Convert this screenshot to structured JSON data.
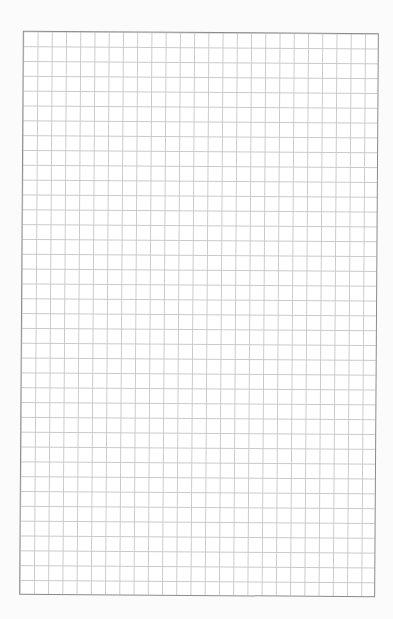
{
  "page": {
    "type": "graph-paper",
    "grid": {
      "columns": 25,
      "rows": 38,
      "line_color": "#c9c9c9",
      "border_color": "#8a8a8a",
      "background": "#ffffff"
    },
    "page_background": "#fbfbfb"
  }
}
